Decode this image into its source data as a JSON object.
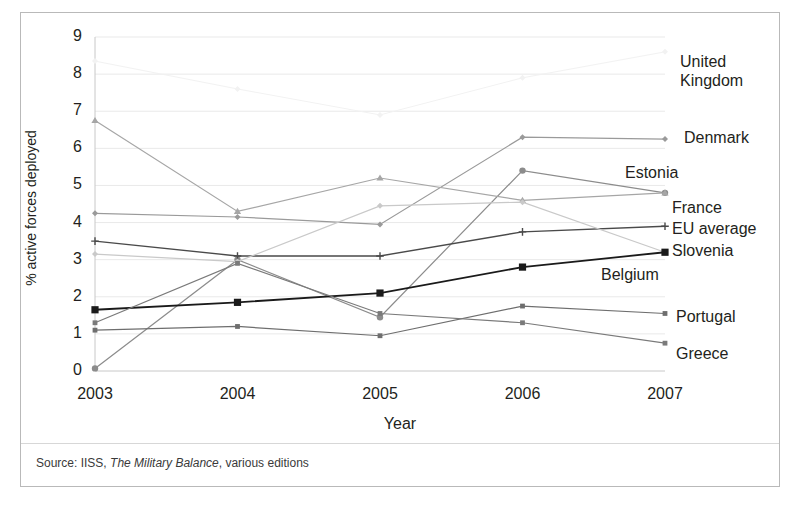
{
  "figure": {
    "source_prefix": "Source: IISS, ",
    "source_italic": "The Military Balance",
    "source_suffix": ", various editions"
  },
  "chart_data": {
    "type": "line",
    "title": "",
    "xlabel": "Year",
    "ylabel": "% active forces deployed",
    "categories": [
      "2003",
      "2004",
      "2005",
      "2006",
      "2007"
    ],
    "x": [
      2003,
      2004,
      2005,
      2006,
      2007
    ],
    "xlim": [
      2003,
      2007
    ],
    "ylim": [
      0,
      9
    ],
    "yticks": [
      "0",
      "1",
      "2",
      "3",
      "4",
      "5",
      "6",
      "7",
      "8",
      "9"
    ],
    "grid": "horizontal",
    "legend_position": "right-inline-labels",
    "series": [
      {
        "name": "United Kingdom",
        "values": [
          8.35,
          7.6,
          6.9,
          7.9,
          8.6
        ],
        "color": "#f2f2f2",
        "marker": "diamond",
        "width": 1.0,
        "label_y": 52,
        "label_x": 680,
        "label_lines": [
          "United",
          "Kingdom"
        ]
      },
      {
        "name": "Denmark",
        "values": [
          4.25,
          4.15,
          3.95,
          6.3,
          6.25
        ],
        "color": "#9a9a9a",
        "marker": "diamond",
        "width": 1.2,
        "label_y": 128,
        "label_x": 684,
        "label_lines": [
          "Denmark"
        ]
      },
      {
        "name": "Estonia",
        "values": [
          0.07,
          3.0,
          1.45,
          5.4,
          4.8
        ],
        "color": "#8c8c8c",
        "marker": "circle",
        "width": 1.2,
        "label_y": 163,
        "label_x": 625,
        "label_lines": [
          "Estonia"
        ]
      },
      {
        "name": "France",
        "values": [
          6.75,
          4.3,
          5.2,
          4.6,
          4.8
        ],
        "color": "#a6a6a6",
        "marker": "triangle",
        "width": 1.2,
        "label_y": 198,
        "label_x": 672,
        "label_lines": [
          "France"
        ]
      },
      {
        "name": "EU average",
        "values": [
          3.5,
          3.1,
          3.1,
          3.75,
          3.9
        ],
        "color": "#4a4a4a",
        "marker": "cross",
        "width": 1.4,
        "label_y": 219,
        "label_x": 672,
        "label_lines": [
          "EU average"
        ]
      },
      {
        "name": "Slovenia",
        "values": [
          3.15,
          2.95,
          4.45,
          4.55,
          3.2
        ],
        "color": "#c9c9c9",
        "marker": "star",
        "width": 1.2,
        "label_y": 241,
        "label_x": 672,
        "label_lines": [
          "Slovenia"
        ]
      },
      {
        "name": "Belgium",
        "values": [
          1.65,
          1.85,
          2.1,
          2.8,
          3.2
        ],
        "color": "#1a1a1a",
        "marker": "square",
        "width": 1.8,
        "label_y": 265,
        "label_x": 601,
        "label_lines": [
          "Belgium"
        ]
      },
      {
        "name": "Portugal",
        "values": [
          1.1,
          1.2,
          0.95,
          1.75,
          1.55
        ],
        "color": "#6e6e6e",
        "marker": "dot",
        "width": 1.2,
        "label_y": 307,
        "label_x": 676,
        "label_lines": [
          "Portugal"
        ]
      },
      {
        "name": "Greece",
        "values": [
          1.3,
          2.9,
          1.55,
          1.3,
          0.75
        ],
        "color": "#7a7a7a",
        "marker": "dot",
        "width": 1.2,
        "label_y": 344,
        "label_x": 676,
        "label_lines": [
          "Greece"
        ]
      }
    ]
  }
}
